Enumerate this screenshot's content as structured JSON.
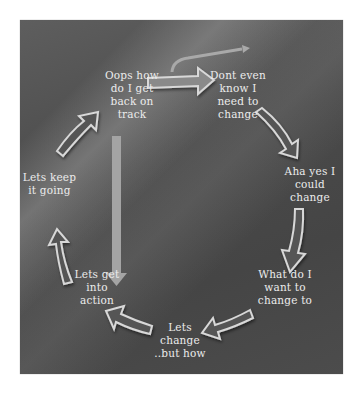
{
  "diagram": {
    "type": "cycle",
    "background_color": "#4a4a4a",
    "text_color": "#ececec",
    "arrow_fill": "#555555",
    "arrow_outline": "#d8d8d8",
    "steps": [
      {
        "id": "step-1",
        "label": "Dont even\nknow I\nneed to\nchange"
      },
      {
        "id": "step-2",
        "label": "Aha yes I\ncould\nchange"
      },
      {
        "id": "step-3",
        "label": "What do I\nwant to\nchange  to"
      },
      {
        "id": "step-4",
        "label": "Lets\nchange\n..but how"
      },
      {
        "id": "step-5",
        "label": "Lets get\ninto\naction"
      },
      {
        "id": "step-6",
        "label": "Lets keep\nit going"
      },
      {
        "id": "step-7",
        "label": "Oops how\ndo I get\nback on\ntrack"
      }
    ],
    "connections": [
      {
        "from": "step-7",
        "to": "step-1",
        "style": "curved-arrow"
      },
      {
        "from": "step-1",
        "to": "step-2",
        "style": "curved-arrow"
      },
      {
        "from": "step-2",
        "to": "step-3",
        "style": "curved-arrow"
      },
      {
        "from": "step-3",
        "to": "step-4",
        "style": "curved-arrow"
      },
      {
        "from": "step-4",
        "to": "step-5",
        "style": "curved-arrow"
      },
      {
        "from": "step-5",
        "to": "step-6",
        "style": "curved-arrow"
      },
      {
        "from": "step-6",
        "to": "step-7",
        "style": "curved-arrow"
      },
      {
        "from": "step-7",
        "to": "step-5",
        "style": "straight-relapse-arrow"
      }
    ]
  }
}
